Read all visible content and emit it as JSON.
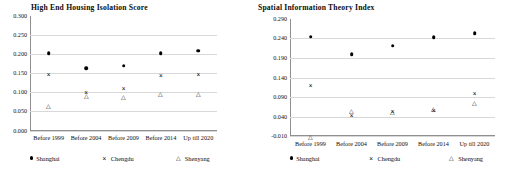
{
  "chart_data": [
    {
      "id": "high-end-housing-isolation-score",
      "type": "scatter",
      "title": "High End Housing Isolation Score",
      "xlabel": "",
      "ylabel": "",
      "grid": true,
      "legend_position": "bottom",
      "categories": [
        "Before 1999",
        "Before 2004",
        "Before 2009",
        "Before 2014",
        "Up till 2020"
      ],
      "ylim": [
        0.0,
        0.3
      ],
      "ytick_step": 0.05,
      "yticks": [
        "0.300",
        "0.250",
        "0.200",
        "0.150",
        "0.100",
        "0.050",
        "0.000"
      ],
      "series": [
        {
          "name": "Shanghai",
          "marker": "filled-circle",
          "values": [
            0.201,
            0.163,
            0.169,
            0.201,
            0.208
          ]
        },
        {
          "name": "Chengdu",
          "marker": "cross",
          "values": [
            0.148,
            0.101,
            0.11,
            0.144,
            0.147
          ]
        },
        {
          "name": "Shenyang",
          "marker": "triangle",
          "values": [
            0.066,
            0.092,
            0.09,
            0.098,
            0.099
          ]
        }
      ]
    },
    {
      "id": "spatial-information-theory-index",
      "type": "scatter",
      "title": "Spatial Information Theory Index",
      "xlabel": "",
      "ylabel": "",
      "grid": true,
      "legend_position": "bottom",
      "categories": [
        "Before 1999",
        "Before 2004",
        "Before 2009",
        "Before 2014",
        "Up till 2020"
      ],
      "ylim": [
        -0.01,
        0.29
      ],
      "ytick_step": 0.05,
      "yticks": [
        "0.290",
        "0.240",
        "0.190",
        "0.140",
        "0.090",
        "0.040",
        "-0.010"
      ],
      "series": [
        {
          "name": "Shanghai",
          "marker": "filled-circle",
          "values": [
            0.245,
            0.2,
            0.222,
            0.244,
            0.254
          ]
        },
        {
          "name": "Chengdu",
          "marker": "cross",
          "values": [
            0.122,
            0.045,
            0.053,
            0.057,
            0.099
          ]
        },
        {
          "name": "Shenyang",
          "marker": "triangle",
          "values": [
            -0.009,
            0.056,
            0.053,
            0.062,
            0.076
          ]
        }
      ]
    }
  ],
  "markers": {
    "filled-circle": "",
    "cross": "×",
    "triangle": "△"
  },
  "colors": {
    "marker": "#000000",
    "grid": "#d8d8d8",
    "axis": "#8f8f8f",
    "text": "#0b0b0b",
    "background": "#ffffff"
  }
}
